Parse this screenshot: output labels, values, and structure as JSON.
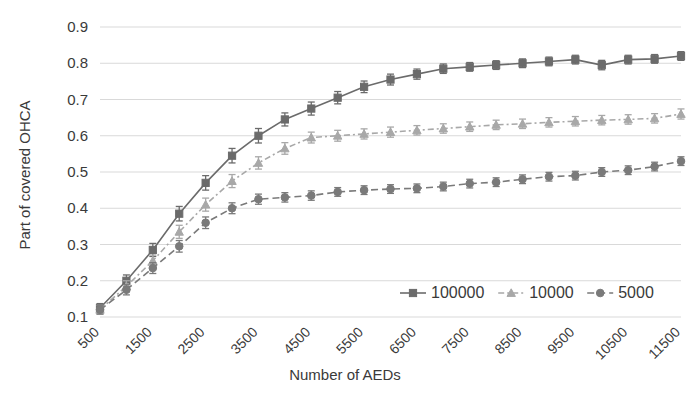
{
  "chart_data": {
    "type": "line",
    "title": "",
    "xlabel": "Number of AEDs",
    "ylabel": "Part of covered OHCA",
    "xlim": [
      500,
      11500
    ],
    "ylim": [
      0.1,
      0.9
    ],
    "grid": true,
    "grid_axis": "y",
    "legend_position": "inside-lower-right",
    "x": [
      500,
      1000,
      1500,
      2000,
      2500,
      3000,
      3500,
      4000,
      4500,
      5000,
      5500,
      6000,
      6500,
      7000,
      7500,
      8000,
      8500,
      9000,
      9500,
      10000,
      10500,
      11000,
      11500
    ],
    "xtick_labels": [
      "500",
      "1500",
      "2500",
      "3500",
      "4500",
      "5500",
      "6500",
      "7500",
      "8500",
      "9500",
      "10500",
      "11500"
    ],
    "xtick_values": [
      500,
      1500,
      2500,
      3500,
      4500,
      5500,
      6500,
      7500,
      8500,
      9500,
      10500,
      11500
    ],
    "ytick_labels": [
      "0.1",
      "0.2",
      "0.3",
      "0.4",
      "0.5",
      "0.6",
      "0.7",
      "0.8",
      "0.9"
    ],
    "ytick_values": [
      0.1,
      0.2,
      0.3,
      0.4,
      0.5,
      0.6,
      0.7,
      0.8,
      0.9
    ],
    "series": [
      {
        "name": "100000",
        "color": "#6b6b6b",
        "marker": "square",
        "linestyle": "solid",
        "values": [
          0.125,
          0.2,
          0.285,
          0.385,
          0.47,
          0.545,
          0.6,
          0.645,
          0.675,
          0.705,
          0.735,
          0.755,
          0.77,
          0.785,
          0.79,
          0.795,
          0.8,
          0.805,
          0.81,
          0.795,
          0.81,
          0.812,
          0.82
        ],
        "errors": [
          0.012,
          0.016,
          0.018,
          0.02,
          0.02,
          0.02,
          0.02,
          0.018,
          0.018,
          0.017,
          0.016,
          0.015,
          0.014,
          0.013,
          0.012,
          0.012,
          0.012,
          0.012,
          0.012,
          0.013,
          0.012,
          0.012,
          0.012
        ]
      },
      {
        "name": "10000",
        "color": "#a8a8a8",
        "marker": "triangle",
        "linestyle": "dotted",
        "values": [
          0.12,
          0.185,
          0.255,
          0.335,
          0.41,
          0.475,
          0.525,
          0.565,
          0.595,
          0.6,
          0.605,
          0.61,
          0.615,
          0.62,
          0.625,
          0.63,
          0.633,
          0.637,
          0.64,
          0.643,
          0.645,
          0.648,
          0.66
        ],
        "errors": [
          0.012,
          0.015,
          0.016,
          0.018,
          0.018,
          0.018,
          0.017,
          0.016,
          0.015,
          0.015,
          0.014,
          0.014,
          0.013,
          0.013,
          0.013,
          0.013,
          0.013,
          0.013,
          0.013,
          0.013,
          0.013,
          0.013,
          0.014
        ]
      },
      {
        "name": "5000",
        "color": "#7a7a7a",
        "marker": "circle",
        "linestyle": "dashed",
        "values": [
          0.12,
          0.175,
          0.235,
          0.295,
          0.36,
          0.4,
          0.425,
          0.43,
          0.435,
          0.445,
          0.45,
          0.453,
          0.455,
          0.46,
          0.468,
          0.472,
          0.48,
          0.487,
          0.49,
          0.5,
          0.505,
          0.515,
          0.53
        ],
        "errors": [
          0.012,
          0.014,
          0.015,
          0.016,
          0.016,
          0.015,
          0.014,
          0.013,
          0.013,
          0.012,
          0.012,
          0.012,
          0.012,
          0.012,
          0.012,
          0.012,
          0.012,
          0.012,
          0.012,
          0.012,
          0.012,
          0.012,
          0.012
        ]
      }
    ]
  },
  "legend": {
    "items": [
      {
        "label": "100000",
        "color": "#6b6b6b",
        "marker": "square",
        "linestyle": "solid"
      },
      {
        "label": "10000",
        "color": "#a8a8a8",
        "marker": "triangle",
        "linestyle": "dotted"
      },
      {
        "label": "5000",
        "color": "#7a7a7a",
        "marker": "circle",
        "linestyle": "dashed"
      }
    ]
  },
  "axes": {
    "x_title": "Number of AEDs",
    "y_title": "Part of covered OHCA"
  }
}
